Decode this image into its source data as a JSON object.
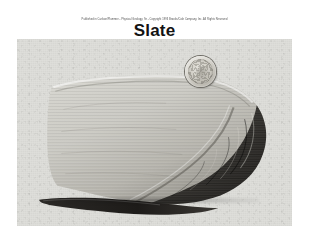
{
  "slide": {
    "attribution": "Published in Carlson/Plummer - Physical Geology, 9e - Copyright 1993 Brooks/Cole Company, Inc. All Rights Reserved",
    "title": "Slate",
    "background_color": "#ffffff",
    "border_color": "#3a3a3a",
    "title_color": "#131313"
  },
  "photo": {
    "caption": "",
    "background_color": "#dedeDA",
    "specimen_name": "slate-slab",
    "specimen_description": "Gray foliated slate slab with dark layered cleavage edge",
    "specimen_light_color": "#cfcfc9",
    "specimen_dark_color": "#2e2c29",
    "scale_object": "coin",
    "scale_object_name": "coin-for-scale"
  }
}
